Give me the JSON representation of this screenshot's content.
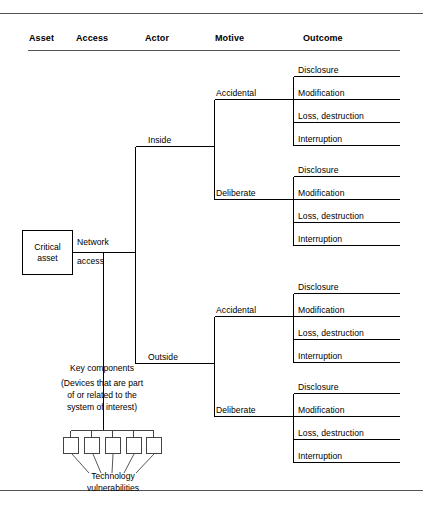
{
  "figure": {
    "type": "threat-tree"
  },
  "headers": [
    {
      "key": "asset",
      "label": "Asset"
    },
    {
      "key": "access",
      "label": "Access"
    },
    {
      "key": "actor",
      "label": "Actor"
    },
    {
      "key": "motive",
      "label": "Motive"
    },
    {
      "key": "outcome",
      "label": "Outcome"
    }
  ],
  "asset": {
    "line1": "Critical",
    "line2": "asset"
  },
  "access": {
    "line1": "Network",
    "line2": "access"
  },
  "actors": [
    {
      "key": "inside",
      "label": "Inside"
    },
    {
      "key": "outside",
      "label": "Outside"
    }
  ],
  "motives": [
    {
      "key": "inside-accidental",
      "label": "Accidental"
    },
    {
      "key": "inside-deliberate",
      "label": "Deliberate"
    },
    {
      "key": "outside-accidental",
      "label": "Accidental"
    },
    {
      "key": "outside-deliberate",
      "label": "Deliberate"
    }
  ],
  "outcome_labels": [
    "Disclosure",
    "Modification",
    "Loss, destruction",
    "Interruption"
  ],
  "outcome_groups": [
    {
      "key": "inside-accidental",
      "items": [
        "Disclosure",
        "Modification",
        "Loss, destruction",
        "Interruption"
      ]
    },
    {
      "key": "inside-deliberate",
      "items": [
        "Disclosure",
        "Modification",
        "Loss, destruction",
        "Interruption"
      ]
    },
    {
      "key": "outside-accidental",
      "items": [
        "Disclosure",
        "Modification",
        "Loss, destruction",
        "Interruption"
      ]
    },
    {
      "key": "outside-deliberate",
      "items": [
        "Disclosure",
        "Modification",
        "Loss, destruction",
        "Interruption"
      ]
    }
  ],
  "key_components": {
    "line1": "Key components",
    "line2": "(Devices that are part",
    "line3": "of or related to the",
    "line4": "system of interest)",
    "box_count": 5
  },
  "vulnerabilities": {
    "line1": "Technology",
    "line2": "vulnerabilities"
  },
  "colors": {
    "line": "#000000",
    "box_border": "#444444",
    "text": "#000000",
    "background": "#ffffff",
    "rule": "#555555"
  }
}
